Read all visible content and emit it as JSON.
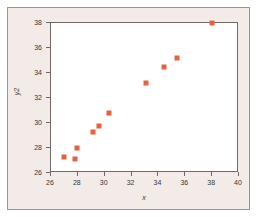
{
  "figure": {
    "background_color": "#f3ebe7",
    "panel_color": "#ffffff",
    "frame_color": "#6e6a68",
    "marker_color": "#e8603c"
  },
  "chart_data": {
    "type": "scatter",
    "title": "",
    "xlabel": "x",
    "ylabel": "y2",
    "xlim": [
      26,
      40
    ],
    "ylim": [
      26,
      38
    ],
    "xticks": [
      26,
      28,
      30,
      32,
      34,
      36,
      38,
      40
    ],
    "yticks": [
      26,
      28,
      30,
      32,
      34,
      36,
      38
    ],
    "xticklabels": [
      "26",
      "28",
      "30",
      "32",
      "34",
      "36",
      "38",
      "40"
    ],
    "yticklabels": [
      "26",
      "28",
      "30",
      "32",
      "34",
      "36",
      "38"
    ],
    "grid": false,
    "legend": null,
    "marker": "square",
    "marker_color": "#e8603c",
    "series": [
      {
        "name": "y2",
        "points": [
          {
            "x": 27.0,
            "y": 27.3
          },
          {
            "x": 27.8,
            "y": 27.1
          },
          {
            "x": 27.9,
            "y": 28.0
          },
          {
            "x": 29.1,
            "y": 29.3
          },
          {
            "x": 29.6,
            "y": 29.8
          },
          {
            "x": 30.3,
            "y": 30.8
          },
          {
            "x": 33.1,
            "y": 33.2
          },
          {
            "x": 34.4,
            "y": 34.5
          },
          {
            "x": 35.4,
            "y": 35.2
          },
          {
            "x": 38.0,
            "y": 38.0
          }
        ]
      }
    ]
  }
}
